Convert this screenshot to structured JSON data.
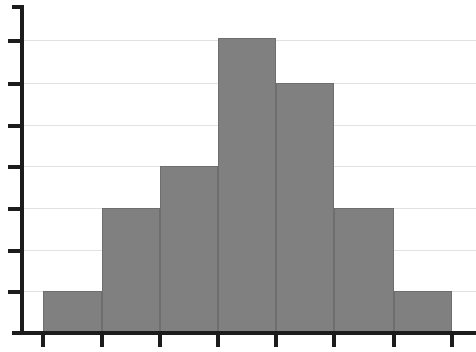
{
  "chart_data": {
    "type": "bar",
    "title": "",
    "subtitle": "",
    "xlabel": "",
    "ylabel": "",
    "categories": [
      "1",
      "2",
      "3",
      "4",
      "5",
      "6",
      "7"
    ],
    "values": [
      1,
      3,
      4,
      7,
      6,
      3,
      1
    ],
    "series": [
      {
        "name": "Frequency",
        "values": [
          1,
          3,
          4,
          7,
          6,
          3,
          1
        ]
      }
    ],
    "bin_edges": [
      0,
      1,
      2,
      3,
      4,
      5,
      6,
      7
    ],
    "ylim": [
      0,
      8
    ],
    "xlim": [
      0,
      7
    ],
    "y_ticks": [
      1,
      2,
      3,
      4,
      5,
      6,
      7
    ],
    "y_tick_labels": [
      "",
      "",
      "",
      "",
      "",
      "",
      ""
    ],
    "x_ticks": [
      0,
      1,
      2,
      3,
      4,
      5,
      6,
      7
    ],
    "x_tick_labels": [
      "",
      "",
      "",
      "",
      "",
      "",
      "",
      ""
    ],
    "grid": true,
    "grid_axis": "y",
    "legend": false,
    "legend_position": "none",
    "annotations": [],
    "colors": {
      "bar_fill": "#808080",
      "bar_border": "#6e6e6e",
      "gridline": "#e2e2e2",
      "axis": "#1c1c1c",
      "background": "#ffffff"
    },
    "geometry": {
      "baseline_y": 333,
      "axis_x": 20,
      "axis_top_y": 5,
      "axis_right_x": 476,
      "axis_left_x": 12,
      "unit_px": 41.8,
      "bar_edges_px": [
        43,
        102,
        160,
        218,
        276,
        334,
        394,
        452
      ],
      "bar_tops_px": [
        291,
        208,
        166,
        38,
        83,
        208,
        291
      ],
      "gridline_y_px": [
        40,
        83,
        125,
        166,
        208,
        250,
        291
      ],
      "x_tick_px": [
        43,
        102,
        160,
        218,
        276,
        334,
        394,
        452
      ]
    }
  }
}
